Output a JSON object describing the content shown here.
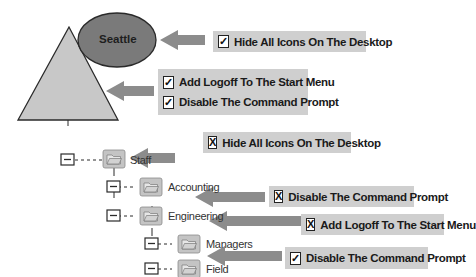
{
  "site": {
    "label": "Seattle",
    "color": "#7a7a7a"
  },
  "domain_triangle": {
    "color": "#c8c8c8"
  },
  "arrow_color": "#8c8c8c",
  "label_bg": "#cfcfcf",
  "policies": {
    "site": [
      {
        "state": "checked",
        "mark": "✓",
        "text": "Hide All Icons On The Desktop"
      }
    ],
    "domain": [
      {
        "state": "checked",
        "mark": "✓",
        "text": "Add Logoff To The Start Menu"
      },
      {
        "state": "checked",
        "mark": "✓",
        "text": "Disable The Command Prompt"
      }
    ],
    "staff": [
      {
        "state": "blocked",
        "mark": "X",
        "text": "Hide All Icons On The Desktop"
      }
    ],
    "engineering": [
      {
        "state": "blocked",
        "mark": "X",
        "text": "Disable The Command Prompt"
      }
    ],
    "managers": [
      {
        "state": "blocked",
        "mark": "X",
        "text": "Add Logoff To The Start Menu"
      }
    ],
    "field": [
      {
        "state": "checked",
        "mark": "✓",
        "text": "Disable The Command Prompt"
      }
    ]
  },
  "tree": {
    "nodes": [
      {
        "name": "Staff",
        "level": 0
      },
      {
        "name": "Accounting",
        "level": 1
      },
      {
        "name": "Engineering",
        "level": 1
      },
      {
        "name": "Managers",
        "level": 2
      },
      {
        "name": "Field",
        "level": 2
      }
    ]
  }
}
